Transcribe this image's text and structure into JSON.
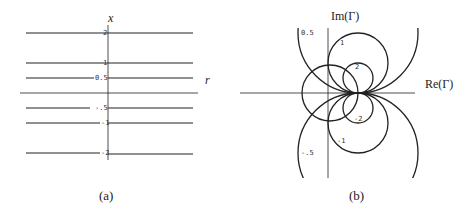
{
  "panel_a": {
    "caption": "(a)",
    "vertical_axis_label": "x",
    "horizontal_axis_label": "r",
    "line_labels": [
      "2",
      "1",
      "0.5",
      "-.5",
      "-1",
      "-2"
    ]
  },
  "panel_b": {
    "caption": "(b)",
    "vertical_axis_label": "Im(Γ)",
    "horizontal_axis_label": "Re(Γ)",
    "circle_labels": [
      "0.5",
      "1",
      "2",
      "-2",
      "-1",
      "-.5"
    ]
  }
}
